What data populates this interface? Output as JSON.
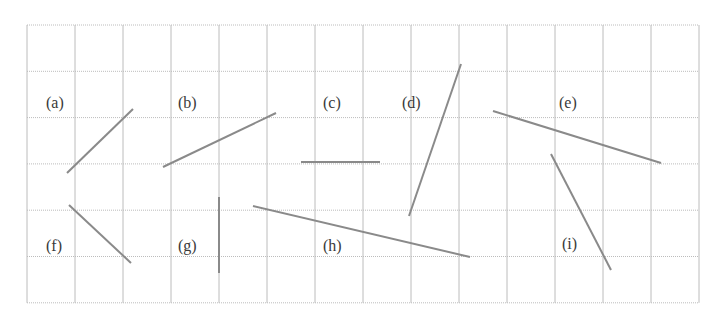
{
  "grid": {
    "x0": 27,
    "y0": 25,
    "cols": 14,
    "rows": 6,
    "cell_w": 48,
    "cell_h": 46.3,
    "line_color": "#bcbcbc"
  },
  "segment_color": "#8a8a8a",
  "label_color": "#3a3a3a",
  "items": [
    {
      "id": "a",
      "label": "(a)",
      "label_x": 46,
      "label_y": 108,
      "x1": 67,
      "y1": 173,
      "x2": 133,
      "y2": 109
    },
    {
      "id": "b",
      "label": "(b)",
      "label_x": 178,
      "label_y": 108,
      "x1": 163,
      "y1": 167,
      "x2": 276,
      "y2": 113
    },
    {
      "id": "c",
      "label": "(c)",
      "label_x": 323,
      "label_y": 108,
      "x1": 301,
      "y1": 162,
      "x2": 380,
      "y2": 162
    },
    {
      "id": "d",
      "label": "(d)",
      "label_x": 402,
      "label_y": 108,
      "x1": 409,
      "y1": 216,
      "x2": 461,
      "y2": 64
    },
    {
      "id": "e",
      "label": "(e)",
      "label_x": 559,
      "label_y": 108,
      "x1": 493,
      "y1": 111,
      "x2": 661,
      "y2": 163
    },
    {
      "id": "f",
      "label": "(f)",
      "label_x": 46,
      "label_y": 251,
      "x1": 69,
      "y1": 205,
      "x2": 131,
      "y2": 263
    },
    {
      "id": "g",
      "label": "(g)",
      "label_x": 178,
      "label_y": 251,
      "x1": 219,
      "y1": 197,
      "x2": 219,
      "y2": 273
    },
    {
      "id": "h",
      "label": "(h)",
      "label_x": 323,
      "label_y": 251,
      "x1": 253,
      "y1": 206,
      "x2": 470,
      "y2": 257
    },
    {
      "id": "i",
      "label": "(i)",
      "label_x": 562,
      "label_y": 249,
      "x1": 551,
      "y1": 154,
      "x2": 611,
      "y2": 270
    }
  ]
}
